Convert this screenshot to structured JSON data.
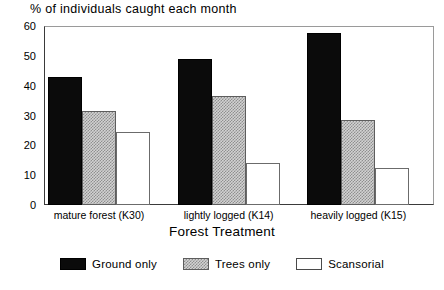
{
  "chart_data": {
    "type": "bar",
    "title": "% of individuals caught each month",
    "xlabel": "Forest Treatment",
    "ylabel": "",
    "ylim": [
      0,
      60
    ],
    "ytick_step": 10,
    "yticks": [
      0,
      10,
      20,
      30,
      40,
      50,
      60
    ],
    "ytick_labels": [
      "0",
      "10",
      "20",
      "30",
      "40",
      "50",
      "60"
    ],
    "grid": false,
    "legend_position": "bottom",
    "categories": [
      "mature forest (K30)",
      "lightly logged (K14)",
      "heavily logged (K15)"
    ],
    "series": [
      {
        "name": "Ground only",
        "color": "#0b0b0b",
        "fill": "solid-black",
        "values": [
          43,
          49,
          57.5
        ]
      },
      {
        "name": "Trees only",
        "color": "#d2d2d2",
        "fill": "gray-hatch",
        "values": [
          31.5,
          36.5,
          28.5
        ]
      },
      {
        "name": "Scansorial",
        "color": "#ffffff",
        "fill": "white-open",
        "values": [
          24.5,
          14,
          12.5
        ]
      }
    ]
  },
  "axis": {
    "frame_color": "#3a3a3a"
  }
}
